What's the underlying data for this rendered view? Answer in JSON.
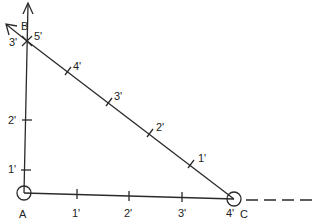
{
  "diagram": {
    "colors": {
      "line": "#2a2a2a",
      "background": "#ffffff"
    },
    "points": {
      "A": {
        "label": "A"
      },
      "B": {
        "label": "B"
      },
      "C": {
        "label": "C"
      }
    },
    "vertical_ticks": [
      "1'",
      "2'",
      "3'"
    ],
    "horizontal_ticks": [
      "1'",
      "2'",
      "3'",
      "4'"
    ],
    "diagonal_ticks": [
      "1'",
      "2'",
      "3'",
      "4'",
      "5'"
    ]
  }
}
